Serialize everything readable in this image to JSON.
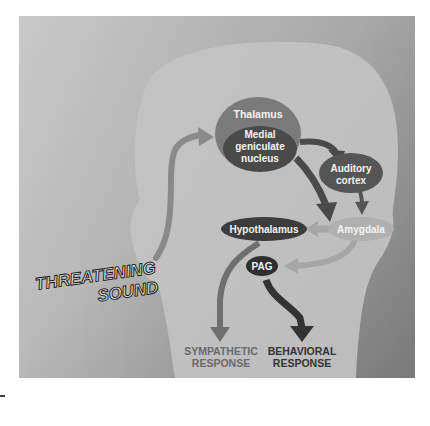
{
  "figure": {
    "stimulus_label": [
      "THREATENING",
      "SOUND"
    ],
    "nodes": {
      "thalamus": "Thalamus",
      "mgn": [
        "Medial",
        "geniculate",
        "nucleus"
      ],
      "auditory_cortex": [
        "Auditory",
        "cortex"
      ],
      "amygdala": "Amygdala",
      "hypothalamus": "Hypothalamus",
      "pag": "PAG"
    },
    "outputs": {
      "sympathetic": [
        "SYMPATHETIC",
        "RESPONSE"
      ],
      "behavioral": [
        "BEHAVIORAL",
        "RESPONSE"
      ]
    },
    "colors": {
      "background_light": "#d4d4d4",
      "background_dark": "#8f8f8f",
      "head": "#bdbdbd",
      "thalamus": "#7a7a7a",
      "mgn": "#4a4a4a",
      "auditory_cortex": "#555555",
      "amygdala": "#b0b0b0",
      "hypothalamus": "#3c3c3c",
      "pag": "#2e2e2e",
      "sympathetic_text": "#6a6a6a",
      "behavioral_text": "#333333"
    }
  }
}
